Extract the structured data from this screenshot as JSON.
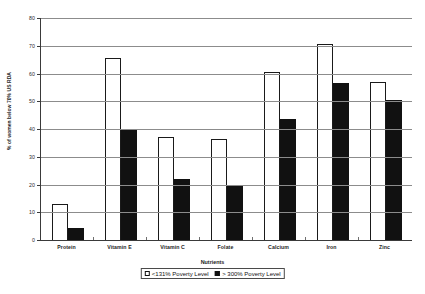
{
  "chart_data": {
    "type": "bar",
    "title": "",
    "xlabel": "Nutrients",
    "ylabel": "% of women below 70% US RDA",
    "categories": [
      "Protein",
      "Vitamin E",
      "Vitamin C",
      "Folate",
      "Calcium",
      "Iron",
      "Zinc"
    ],
    "series": [
      {
        "name": "<131% Poverty Level",
        "fill": "#ffffff",
        "values": [
          13,
          65.5,
          37,
          36.5,
          60.5,
          70.5,
          57
        ]
      },
      {
        "name": "> 300% Poverty Level",
        "fill": "#111111",
        "values": [
          4.5,
          39.5,
          22,
          19.5,
          43.5,
          56.5,
          50.5
        ]
      }
    ],
    "ylim": [
      0,
      80
    ],
    "yticks": [
      0,
      10,
      20,
      30,
      40,
      50,
      60,
      70,
      80
    ],
    "ytick_labels": [
      "0",
      "10",
      "20",
      "30",
      "40",
      "50",
      "60",
      "70",
      "80"
    ],
    "grid": true,
    "legend_position": "bottom"
  },
  "legend": {
    "items": [
      {
        "label": "<131% Poverty Level",
        "swatch": "light"
      },
      {
        "label": "> 300% Poverty Level",
        "swatch": "dark"
      }
    ]
  }
}
